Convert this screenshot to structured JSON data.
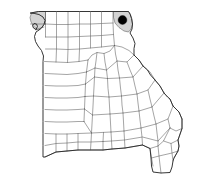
{
  "figure": {
    "kind": "locator-map",
    "alt_text": "Outline map of Missouri showing county boundaries with one northeastern county marked by a filled black dot",
    "background_color": "#ffffff",
    "width_px": 217,
    "height_px": 185
  },
  "map": {
    "state_outline": {
      "name": "missouri-state-outline",
      "stroke_color": "#2b2b2b",
      "fill_color": "#ffffff",
      "stroke_width": 0.95
    },
    "county_boundaries": {
      "name": "county-boundary-lines",
      "stroke_color": "#5a5a5a",
      "fill_color": "#ffffff",
      "stroke_width": 0.55,
      "count_visible": 114
    },
    "shaded_regions": [
      {
        "name": "northwest-shaded-county",
        "fill_color": "#d3d3d3",
        "position": "northwest corner"
      },
      {
        "name": "northeast-shaded-county",
        "fill_color": "#d3d3d3",
        "position": "northeast corner"
      }
    ],
    "markers": [
      {
        "name": "highlighted-county-dot",
        "shape": "filled-circle",
        "color": "#000000",
        "radius_px": 4.4,
        "x_px": 122.5,
        "y_px": 20.0,
        "position": "northeast corner of state"
      }
    ]
  }
}
